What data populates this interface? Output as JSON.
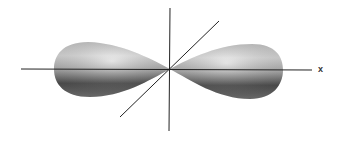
{
  "diagram": {
    "type": "p-orbital",
    "axes": {
      "x_label": "x"
    },
    "colors": {
      "lobe_light": "#e6e6e6",
      "lobe_dark": "#4a4a4a",
      "axis": "#222222",
      "background": "#ffffff"
    }
  }
}
